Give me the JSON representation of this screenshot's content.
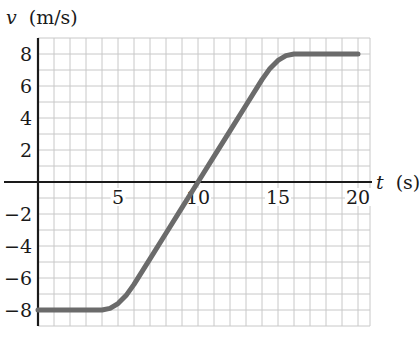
{
  "chart_data": {
    "type": "line",
    "title": "",
    "xlabel": "t (s)",
    "ylabel": "v (m/s)",
    "xlabel_var": "t",
    "xlabel_unit": "(s)",
    "ylabel_var": "v",
    "ylabel_unit": "(m/s)",
    "xlim": [
      0,
      20.7
    ],
    "ylim": [
      -9,
      9
    ],
    "x_ticks": [
      5,
      10,
      15,
      20
    ],
    "x_tick_labels": [
      "5",
      "10",
      "15",
      "20"
    ],
    "y_ticks": [
      8,
      6,
      4,
      2,
      -2,
      -4,
      -6,
      -8
    ],
    "y_tick_labels": [
      "8",
      "6",
      "4",
      "2",
      "−2",
      "−4",
      "−6",
      "−8"
    ],
    "grid": true,
    "grid_step_x": 1,
    "grid_step_y": 1,
    "legend": null,
    "series": [
      {
        "name": "v(t)",
        "color": "#6b6b6b",
        "x": [
          0,
          4,
          4.5,
          5,
          5.5,
          6,
          7,
          8,
          9,
          10,
          11,
          12,
          13,
          14,
          14.5,
          15,
          15.5,
          16,
          20
        ],
        "values": [
          -8,
          -8,
          -7.9,
          -7.6,
          -7.1,
          -6.4,
          -4.8,
          -3.2,
          -1.6,
          0,
          1.6,
          3.2,
          4.8,
          6.4,
          7.1,
          7.6,
          7.9,
          8,
          8
        ]
      }
    ]
  },
  "colors": {
    "grid": "#c8c8c8",
    "axis": "#1a1a1a",
    "curve": "#6b6b6b",
    "background": "#ffffff"
  }
}
